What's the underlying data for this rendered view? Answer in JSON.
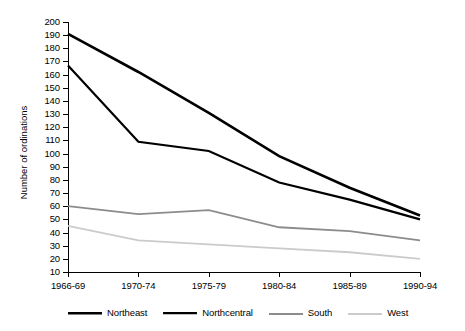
{
  "chart_data": {
    "type": "line",
    "title": "",
    "xlabel": "",
    "ylabel": "Number of ordinations",
    "categories": [
      "1966-69",
      "1970-74",
      "1975-79",
      "1980-84",
      "1985-89",
      "1990-94"
    ],
    "ylim": [
      10,
      200
    ],
    "ytick_step": 10,
    "yticks": [
      200,
      190,
      180,
      170,
      160,
      150,
      140,
      130,
      120,
      110,
      100,
      90,
      80,
      70,
      60,
      50,
      40,
      30,
      20,
      10
    ],
    "grid": false,
    "legend_position": "bottom",
    "series": [
      {
        "name": "Northeast",
        "color": "#000000",
        "width": 2.6,
        "values": [
          191,
          162,
          131,
          98,
          74,
          53
        ]
      },
      {
        "name": "Northcentral",
        "color": "#000000",
        "width": 2.2,
        "values": [
          167,
          109,
          102,
          78,
          65,
          50
        ]
      },
      {
        "name": "South",
        "color": "#8c8c8c",
        "width": 1.8,
        "values": [
          60,
          54,
          57,
          44,
          41,
          34
        ]
      },
      {
        "name": "West",
        "color": "#cbcbcb",
        "width": 1.8,
        "values": [
          45,
          34,
          31,
          28,
          25,
          20
        ]
      }
    ]
  },
  "axes": {
    "y_title": "Number of ordinations"
  },
  "legend": {
    "items": [
      {
        "label": "Northeast"
      },
      {
        "label": "Northcentral"
      },
      {
        "label": "South"
      },
      {
        "label": "West"
      }
    ]
  }
}
